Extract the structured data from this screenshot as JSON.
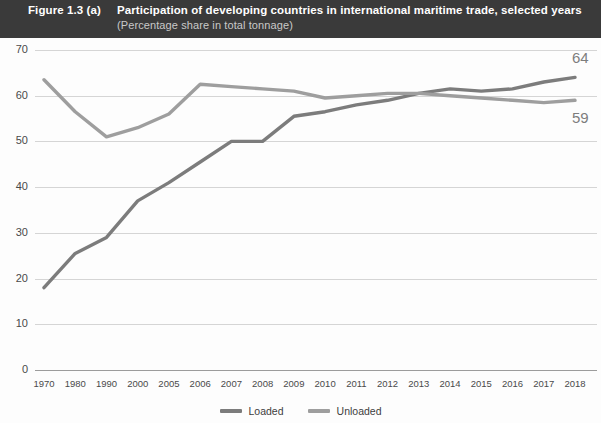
{
  "header": {
    "figure_number": "Figure 1.3 (a)",
    "title": "Participation of developing countries in international maritime trade, selected years",
    "subtitle": "(Percentage share in total tonnage)",
    "background_color": "#3a3a3a",
    "title_color": "#ffffff",
    "subtitle_color": "#c9c9c9"
  },
  "colors": {
    "loaded": "#7c7c7c",
    "unloaded": "#9e9e9e",
    "gridline": "#d5d5d5",
    "axis": "#9c9c9c",
    "tick_text": "#4a4a4a",
    "end_label": "#7d7d7d"
  },
  "legend": {
    "position": "bottom-center",
    "items": [
      {
        "label": "Loaded",
        "color": "#7c7c7c"
      },
      {
        "label": "Unloaded",
        "color": "#9e9e9e"
      }
    ]
  },
  "end_labels": {
    "loaded": "64",
    "unloaded": "59"
  },
  "chart_data": {
    "type": "line",
    "title": "Participation of developing countries in international maritime trade, selected years",
    "subtitle": "(Percentage share in total tonnage)",
    "xlabel": "",
    "ylabel": "",
    "ylim": [
      0,
      70
    ],
    "ytick_step": 10,
    "yticks": [
      0,
      10,
      20,
      30,
      40,
      50,
      60,
      70
    ],
    "grid": true,
    "legend": "bottom-center",
    "categories": [
      "1970",
      "1980",
      "1990",
      "2000",
      "2005",
      "2006",
      "2007",
      "2008",
      "2009",
      "2010",
      "2011",
      "2012",
      "2013",
      "2014",
      "2015",
      "2016",
      "2017",
      "2018"
    ],
    "series": [
      {
        "name": "Loaded",
        "color": "#7c7c7c",
        "values": [
          18,
          25.5,
          29,
          37,
          41,
          45.5,
          50,
          50,
          55.5,
          56.5,
          58,
          59,
          60.5,
          61.5,
          61,
          61.5,
          63,
          64
        ],
        "end_label": "64"
      },
      {
        "name": "Unloaded",
        "color": "#9e9e9e",
        "values": [
          63.5,
          56.5,
          51,
          53,
          56,
          62.5,
          62,
          61.5,
          61,
          59.5,
          60,
          60.5,
          60.5,
          60,
          59.5,
          59,
          58.5,
          59
        ],
        "end_label": "59"
      }
    ]
  }
}
